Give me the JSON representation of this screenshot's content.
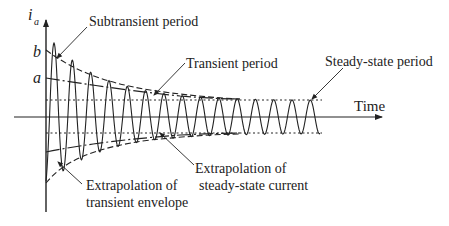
{
  "figure": {
    "y_axis_label": "i",
    "y_axis_subscript": "a",
    "x_axis_label": "Time",
    "level_b": "b",
    "level_a": "a"
  },
  "annotations": {
    "subtransient": "Subtransient period",
    "transient": "Transient period",
    "steady_state": "Steady-state period",
    "extrap_envelope_line1": "Extrapolation of",
    "extrap_envelope_line2": "transient envelope",
    "extrap_steady_line1": "Extrapolation of",
    "extrap_steady_line2": "steady-state current"
  },
  "colors": {
    "ink": "#222222",
    "background": "#ffffff"
  }
}
